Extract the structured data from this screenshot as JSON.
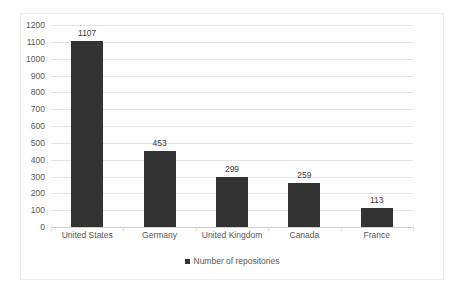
{
  "chart_data": {
    "type": "bar",
    "title": "",
    "subtitle": "",
    "xlabel": "",
    "ylabel": "",
    "categories": [
      "United States",
      "Germany",
      "United Kingdom",
      "Canada",
      "France"
    ],
    "values": [
      1107,
      453,
      299,
      259,
      113
    ],
    "data_labels": [
      "1107",
      "453",
      "299",
      "259",
      "113"
    ],
    "series": [
      {
        "name": "Number of repositories",
        "values": [
          1107,
          453,
          299,
          259,
          113
        ],
        "color": "#333333"
      }
    ],
    "ylim": [
      0,
      1200
    ],
    "ytick_step": 100,
    "ytick_labels": [
      "0",
      "100",
      "200",
      "300",
      "400",
      "500",
      "600",
      "700",
      "800",
      "900",
      "1000",
      "1100",
      "1200"
    ],
    "ytick_values": [
      0,
      100,
      200,
      300,
      400,
      500,
      600,
      700,
      800,
      900,
      1000,
      1100,
      1200
    ],
    "grid": "horizontal",
    "legend": {
      "position": "bottom",
      "entries": [
        {
          "label": "Number of repositories",
          "color": "#333333",
          "marker": "square-swatch"
        }
      ]
    },
    "colors": {
      "bar": "#333333",
      "gridline": "#e4e4e4",
      "axis": "#d0d0d0",
      "text": "#595959",
      "frame": "#ececec",
      "background": "#ffffff"
    }
  }
}
